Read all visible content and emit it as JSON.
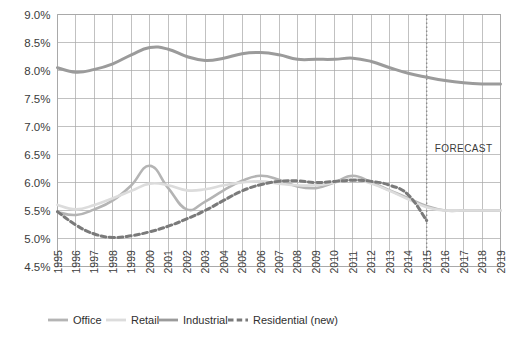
{
  "chart_data": {
    "type": "line",
    "title": "",
    "subtitle": "",
    "xlabel": "",
    "ylabel": "",
    "grid": true,
    "legend_position": "bottom",
    "ylim": [
      4.5,
      9.0
    ],
    "ytick_step": 0.5,
    "ytick_labels": [
      "9.0%",
      "8.5%",
      "8.0%",
      "7.5%",
      "7.0%",
      "6.5%",
      "6.0%",
      "5.5%",
      "5.0%",
      "4.5%"
    ],
    "ytick_values": [
      9.0,
      8.5,
      8.0,
      7.5,
      7.0,
      6.5,
      6.0,
      5.5,
      5.0,
      4.5
    ],
    "x": [
      1995,
      1996,
      1997,
      1998,
      1999,
      2000,
      2001,
      2002,
      2003,
      2004,
      2005,
      2006,
      2007,
      2008,
      2009,
      2010,
      2011,
      2012,
      2013,
      2014,
      2015,
      2016,
      2017,
      2018,
      2019
    ],
    "categories": [
      "1995",
      "1996",
      "1997",
      "1998",
      "1999",
      "2000",
      "2001",
      "2002",
      "2003",
      "2004",
      "2005",
      "2006",
      "2007",
      "2008",
      "2009",
      "2010",
      "2011",
      "2012",
      "2013",
      "2014",
      "2015",
      "2016",
      "2017",
      "2018",
      "2019"
    ],
    "series": [
      {
        "name": "Office",
        "color": "#b4b4b4",
        "style": "solid",
        "width": 2.6,
        "values": [
          5.47,
          5.42,
          5.52,
          5.68,
          5.95,
          6.3,
          5.9,
          5.52,
          5.66,
          5.86,
          6.03,
          6.12,
          6.05,
          5.93,
          5.9,
          6.0,
          6.12,
          6.0,
          5.86,
          5.72,
          5.58,
          5.5,
          5.5,
          5.5,
          5.5
        ]
      },
      {
        "name": "Retail",
        "color": "#dcdcdc",
        "style": "solid",
        "width": 2.6,
        "values": [
          5.6,
          5.52,
          5.6,
          5.72,
          5.85,
          5.98,
          5.95,
          5.86,
          5.88,
          5.95,
          6.0,
          6.02,
          5.98,
          5.95,
          5.95,
          6.0,
          6.06,
          5.98,
          5.85,
          5.7,
          5.56,
          5.5,
          5.5,
          5.5,
          5.5
        ]
      },
      {
        "name": "Industrial",
        "color": "#9b9b9b",
        "style": "solid",
        "width": 3.0,
        "values": [
          8.05,
          7.97,
          8.02,
          8.12,
          8.28,
          8.41,
          8.38,
          8.25,
          8.18,
          8.22,
          8.3,
          8.32,
          8.28,
          8.2,
          8.2,
          8.2,
          8.22,
          8.16,
          8.05,
          7.95,
          7.88,
          7.82,
          7.78,
          7.76,
          7.76
        ]
      },
      {
        "name": "Residential (new)",
        "color": "#7a7a7a",
        "style": "dashed",
        "width": 3.0,
        "values": [
          5.48,
          5.24,
          5.08,
          5.02,
          5.05,
          5.12,
          5.22,
          5.35,
          5.5,
          5.68,
          5.85,
          5.96,
          6.02,
          6.03,
          6.0,
          6.02,
          6.04,
          6.02,
          5.95,
          5.78,
          5.32,
          null,
          null,
          null,
          null
        ]
      }
    ],
    "annotations": [
      {
        "name": "forecast-label",
        "text": "FORECAST",
        "x": 2017.0,
        "y": 6.55
      },
      {
        "name": "forecast-divider",
        "type": "vline",
        "x": 2015.0,
        "style": "dotted",
        "color": "#8d8d8d"
      }
    ],
    "legend": [
      {
        "label": "Office",
        "color": "#b4b4b4",
        "style": "solid"
      },
      {
        "label": "Retail",
        "color": "#dcdcdc",
        "style": "solid"
      },
      {
        "label": "Industrial",
        "color": "#9b9b9b",
        "style": "solid"
      },
      {
        "label": "Residential (new)",
        "color": "#7a7a7a",
        "style": "dashed"
      }
    ]
  }
}
